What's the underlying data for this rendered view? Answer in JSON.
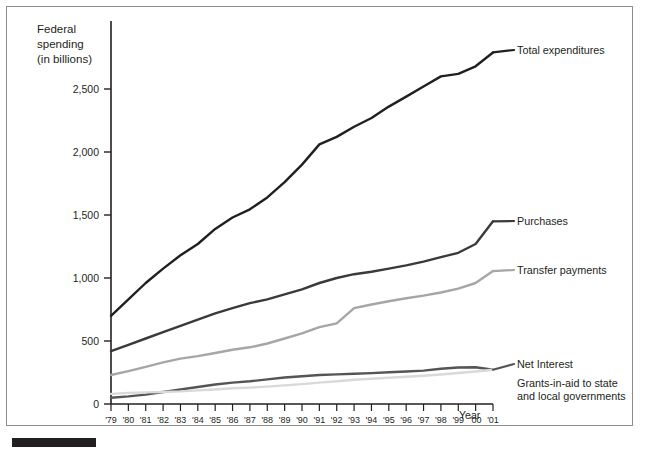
{
  "chart_data": {
    "type": "line",
    "title": "",
    "ylabel": "Federal spending\n(in billions)",
    "ylabel_lines": [
      "Federal",
      "spending",
      "(in billions)"
    ],
    "xlabel": "Year",
    "ylim": [
      0,
      2900
    ],
    "yticks": [
      0,
      500,
      1000,
      1500,
      2000,
      2500
    ],
    "ytick_labels": [
      "0",
      "500",
      "1,000",
      "1,500",
      "2,000",
      "2,500"
    ],
    "grid": false,
    "legend_position": "right-inline-labels",
    "categories": [
      "'79",
      "'80",
      "'81",
      "'82",
      "'83",
      "'84",
      "'85",
      "'86",
      "'87",
      "'88",
      "'89",
      "'90",
      "'91",
      "'92",
      "'93",
      "'94",
      "'95",
      "'96",
      "'97",
      "'98",
      "'99",
      "'00",
      "'01"
    ],
    "series": [
      {
        "name": "Total expenditures",
        "color": "#231f20",
        "values": [
          700,
          830,
          960,
          1075,
          1180,
          1270,
          1390,
          1480,
          1545,
          1640,
          1760,
          1900,
          2060,
          2120,
          2200,
          2270,
          2360,
          2440,
          2520,
          2600,
          2620,
          2680,
          2790
        ]
      },
      {
        "name": "Purchases",
        "color": "#3a3a3a",
        "values": [
          420,
          470,
          520,
          570,
          620,
          670,
          720,
          760,
          800,
          830,
          870,
          910,
          960,
          1000,
          1030,
          1050,
          1075,
          1100,
          1130,
          1165,
          1200,
          1270,
          1450
        ]
      },
      {
        "name": "Transfer payments",
        "color": "#a6a6a6",
        "values": [
          230,
          260,
          295,
          330,
          360,
          380,
          405,
          430,
          450,
          480,
          520,
          560,
          610,
          640,
          760,
          790,
          815,
          840,
          860,
          885,
          915,
          960,
          1055
        ]
      },
      {
        "name": "Net Interest",
        "color": "#555555",
        "values": [
          50,
          60,
          75,
          95,
          115,
          135,
          155,
          170,
          180,
          195,
          210,
          220,
          230,
          235,
          240,
          245,
          252,
          258,
          265,
          280,
          290,
          292,
          272
        ]
      },
      {
        "name": "Grants-in-aid to state and local governments",
        "color": "#d9d9d9",
        "values": [
          80,
          88,
          92,
          95,
          100,
          108,
          115,
          125,
          130,
          138,
          148,
          158,
          170,
          180,
          192,
          200,
          208,
          216,
          224,
          234,
          246,
          258,
          272
        ]
      }
    ],
    "series_labels": [
      {
        "text": "Total expenditures",
        "x": 510,
        "y": 47
      },
      {
        "text": "Purchases",
        "x": 510,
        "y": 218
      },
      {
        "text": "Transfer payments",
        "x": 510,
        "y": 267
      },
      {
        "text": "Net Interest",
        "x": 510,
        "y": 361
      },
      {
        "text": "Grants-in-aid to state",
        "x": 510,
        "y": 380
      },
      {
        "text": "and local governments",
        "x": 510,
        "y": 393
      }
    ]
  }
}
